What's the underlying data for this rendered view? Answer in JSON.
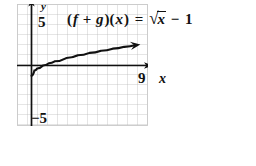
{
  "figure": {
    "kind": "coordinate-graph",
    "equation": {
      "lhs_open": "(",
      "f": "f",
      "plus": " + ",
      "g": "g",
      "lhs_close": ")(",
      "x_arg": "x",
      "lhs_end": ")",
      "equals": " = ",
      "radical_glyph": "√",
      "radicand": "x",
      "minus": " − ",
      "constant": "1",
      "full_text": "(f + g)(x) = √x − 1"
    },
    "axes": {
      "y_axis_label": "y",
      "x_axis_label": "x",
      "y_top_tick_label": "5",
      "y_bottom_tick_label": "−5",
      "x_right_tick_label": "9"
    },
    "colors": {
      "grid_line": "#b9b9b9",
      "grid_border": "#cfcfcf",
      "axis": "#111111",
      "curve": "#111111",
      "background": "#ffffff",
      "text": "#111111"
    }
  },
  "chart_data": {
    "type": "line",
    "title": "(f + g)(x) = √x − 1",
    "xlabel": "x",
    "ylabel": "y",
    "xlim": [
      -2,
      11
    ],
    "ylim": [
      -6,
      6
    ],
    "xticks": [
      9
    ],
    "yticks": [
      5,
      -5
    ],
    "xtick_labels": [
      "9"
    ],
    "ytick_labels": [
      "5",
      "−5"
    ],
    "grid": true,
    "grid_step": 1,
    "legend": null,
    "series": [
      {
        "name": "(f + g)(x) = √x − 1",
        "arrow_at_end": true,
        "x": [
          0.0,
          0.25,
          0.5,
          1.0,
          1.5,
          2.0,
          3.0,
          4.0,
          5.0,
          6.0,
          7.0,
          8.0,
          9.0,
          10.0
        ],
        "y": [
          -1.0,
          -0.5,
          -0.29,
          0.0,
          0.22,
          0.41,
          0.73,
          1.0,
          1.24,
          1.45,
          1.65,
          1.83,
          2.0,
          2.16
        ]
      }
    ]
  }
}
